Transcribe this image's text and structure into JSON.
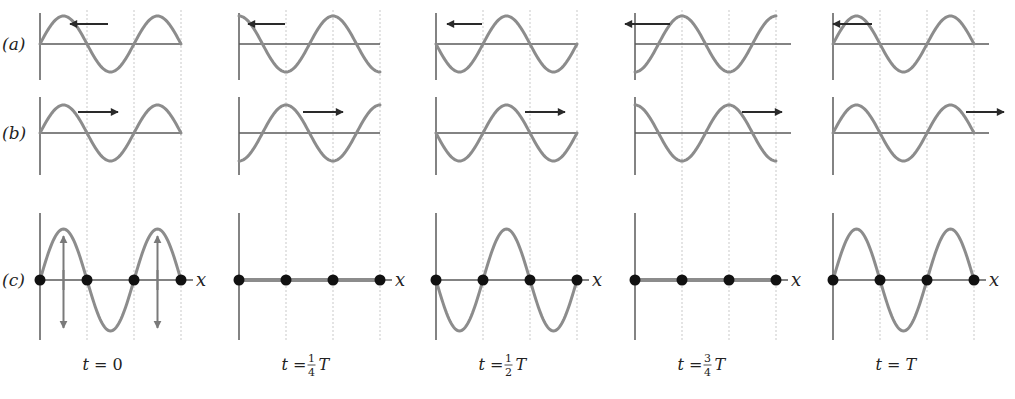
{
  "figure": {
    "row_labels": {
      "a": "(a)",
      "b": "(b)",
      "c": "(c)"
    },
    "axis_label": "x",
    "colors": {
      "wave": "#8c8c8c",
      "arrow": "#2a2a2a",
      "node": "#111111",
      "grid": "#c9c9c9",
      "axis": "#5a5a5a"
    },
    "panels": [
      {
        "id": "t0",
        "time_prefix": "t =",
        "time_num": "",
        "time_den": "",
        "time_suffix": "0",
        "a_phase": 0,
        "b_phase": 0,
        "a_arrow": "left",
        "b_arrow": "right",
        "c_amp": 1,
        "c_has_velocity_arrows": true
      },
      {
        "id": "t14",
        "time_prefix": "t =",
        "time_num": "1",
        "time_den": "4",
        "time_suffix": "T",
        "a_phase": 0.25,
        "b_phase": -0.25,
        "a_arrow": "left",
        "b_arrow": "right",
        "c_amp": 0,
        "c_has_velocity_arrows": false
      },
      {
        "id": "t12",
        "time_prefix": "t =",
        "time_num": "1",
        "time_den": "2",
        "time_suffix": "T",
        "a_phase": 0.5,
        "b_phase": -0.5,
        "a_arrow": "left",
        "b_arrow": "right",
        "c_amp": -1,
        "c_has_velocity_arrows": false
      },
      {
        "id": "t34",
        "time_prefix": "t =",
        "time_num": "3",
        "time_den": "4",
        "time_suffix": "T",
        "a_phase": 0.75,
        "b_phase": -0.75,
        "a_arrow": "left",
        "b_arrow": "right",
        "c_amp": 0,
        "c_has_velocity_arrows": false
      },
      {
        "id": "tT",
        "time_prefix": "t =",
        "time_num": "",
        "time_den": "",
        "time_suffix": "T",
        "a_phase": 1,
        "b_phase": -1,
        "a_arrow": "left",
        "b_arrow": "right",
        "c_amp": 1,
        "c_has_velocity_arrows": false
      }
    ],
    "time_labels": [
      "t = 0",
      "t = 1/4 T",
      "t = 1/2 T",
      "t = 3/4 T",
      "t = T"
    ]
  }
}
